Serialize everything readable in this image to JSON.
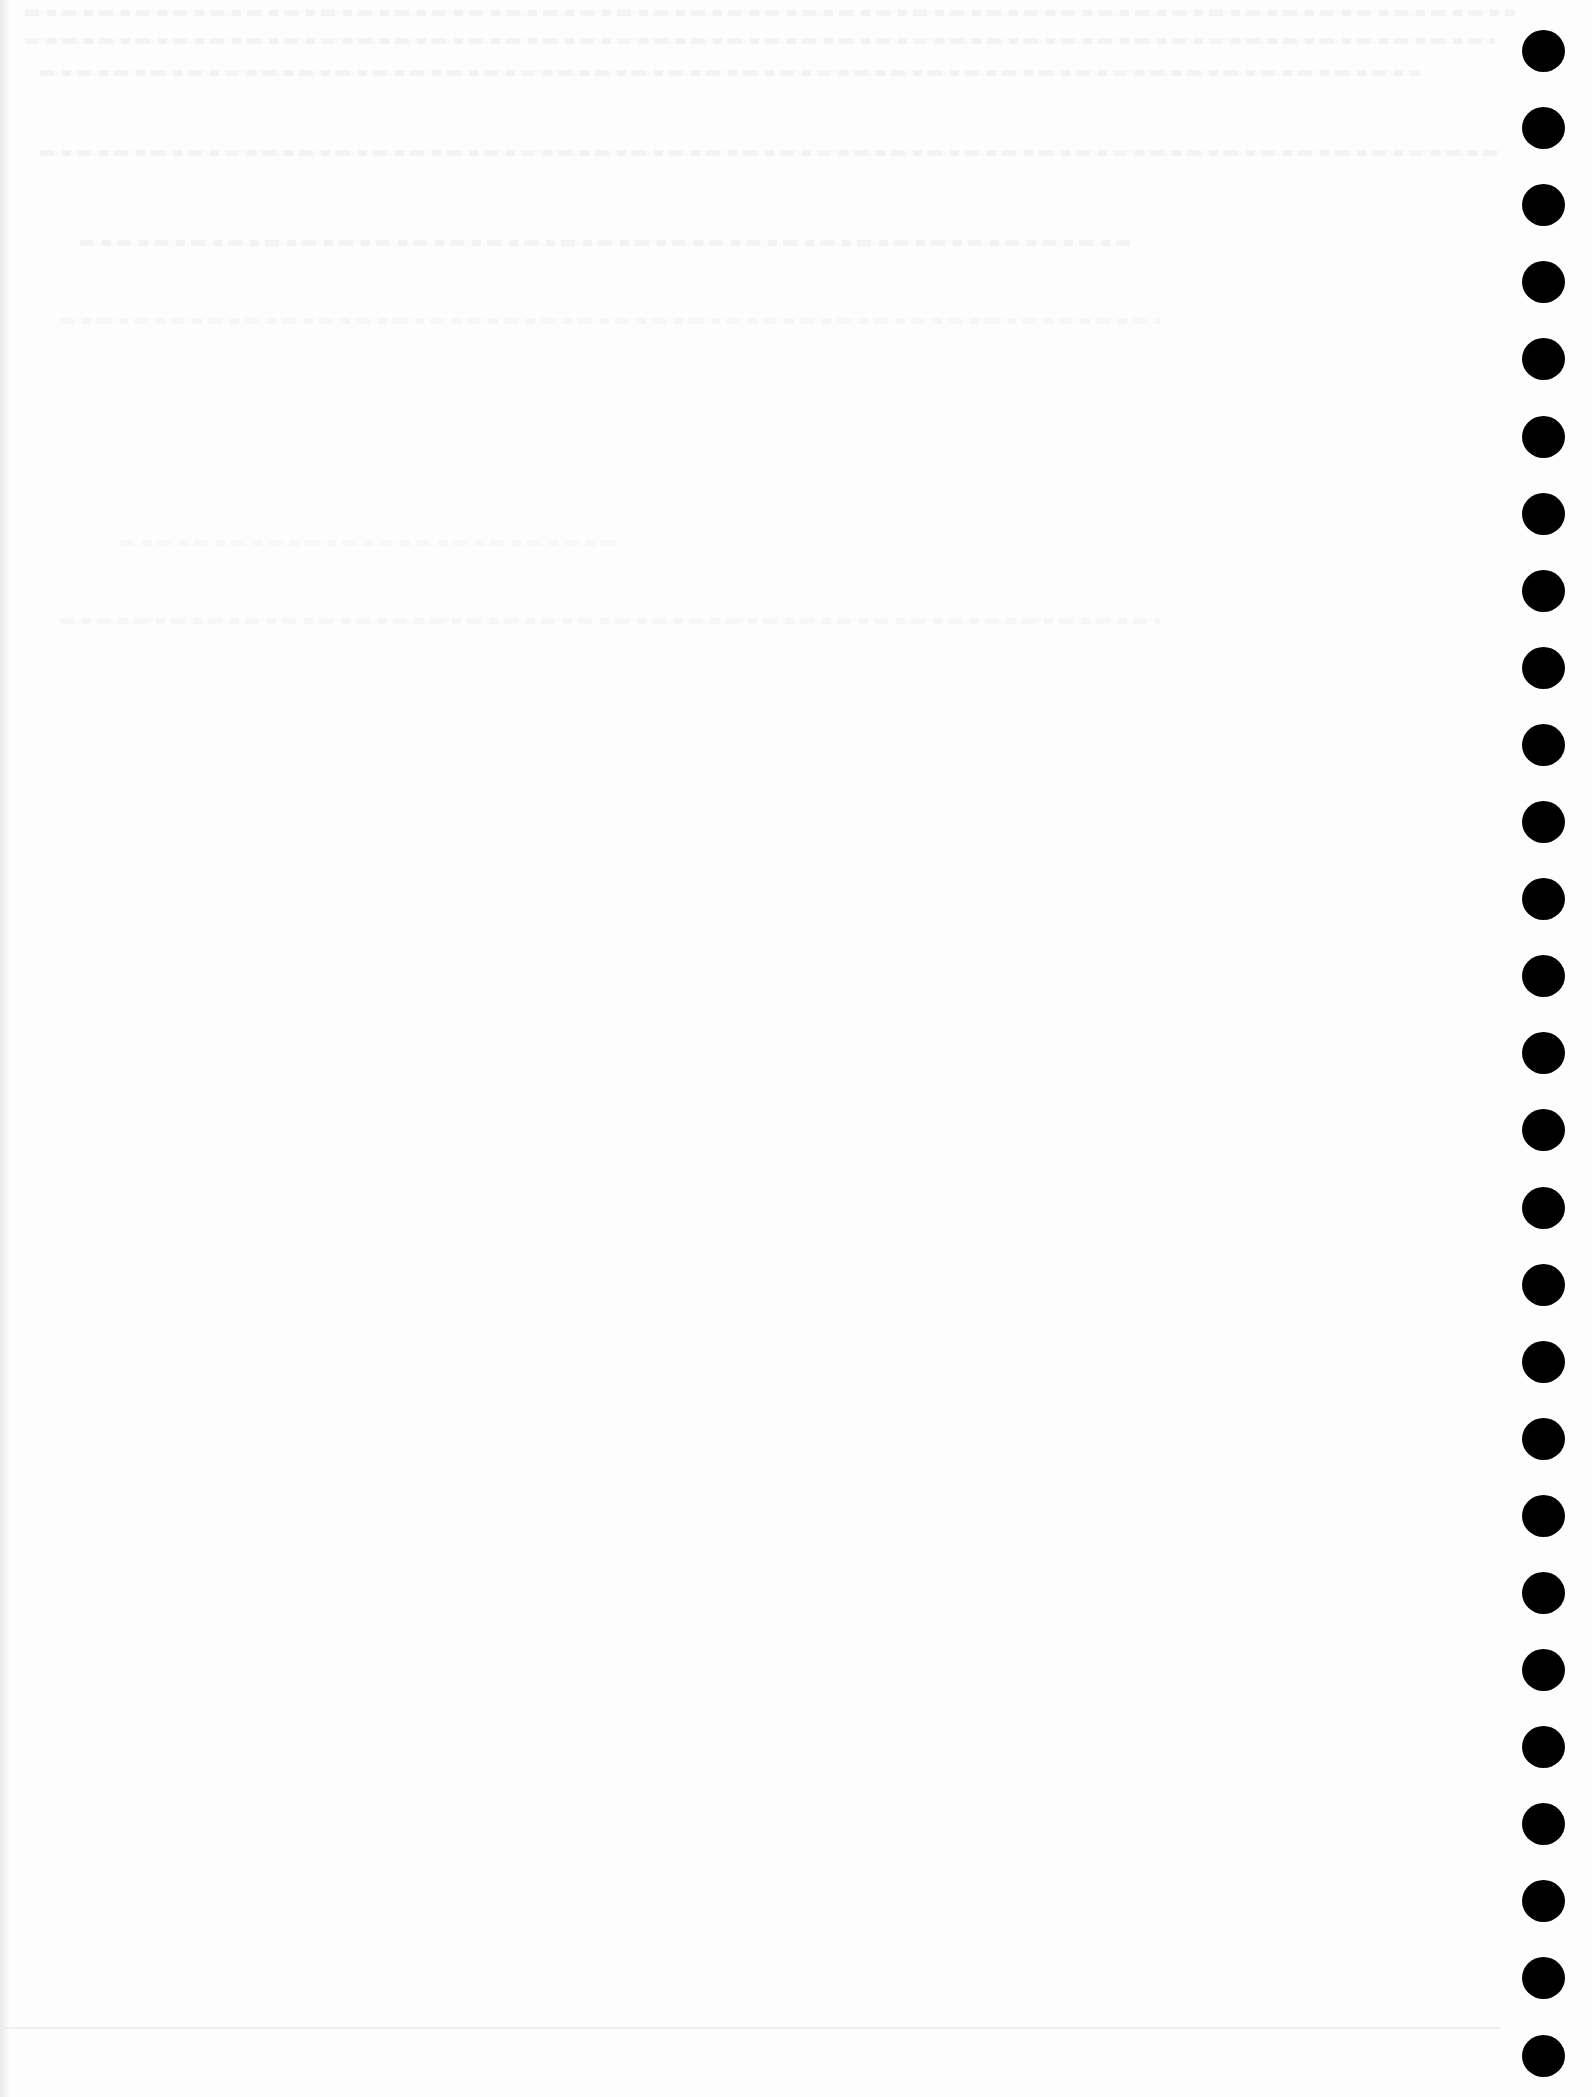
{
  "document": {
    "type": "scanned-page",
    "background_color": "#fdfdfd",
    "text_legible": false
  },
  "binding_holes": {
    "count": 27,
    "color": "#000000",
    "x": 1522,
    "first_top": 30,
    "spacing": 77.1,
    "diameter": 43
  }
}
